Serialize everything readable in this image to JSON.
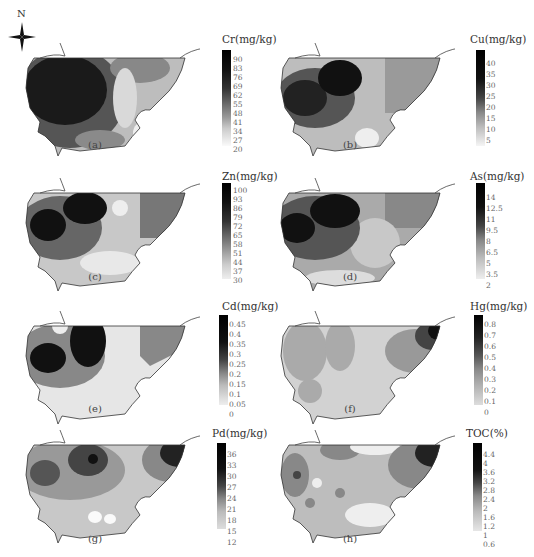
{
  "figure": {
    "north_label": "N",
    "panels": [
      {
        "id": "a",
        "caption": "(a)",
        "legend_title": "Cr(mg/kg)",
        "ticks": [
          "90",
          "83",
          "76",
          "69",
          "62",
          "55",
          "48",
          "41",
          "34",
          "27",
          "20"
        ]
      },
      {
        "id": "b",
        "caption": "(b)",
        "legend_title": "Cu(mg/kg)",
        "ticks": [
          "40",
          "35",
          "30",
          "25",
          "20",
          "15",
          "10",
          "5"
        ]
      },
      {
        "id": "c",
        "caption": "(c)",
        "legend_title": "Zn(mg/kg)",
        "ticks": [
          "100",
          "93",
          "86",
          "79",
          "72",
          "65",
          "58",
          "51",
          "44",
          "37",
          "30"
        ]
      },
      {
        "id": "d",
        "caption": "(d)",
        "legend_title": "As(mg/kg)",
        "ticks": [
          "14",
          "12.5",
          "11",
          "9.5",
          "8",
          "6.5",
          "5",
          "3.5",
          "2"
        ]
      },
      {
        "id": "e",
        "caption": "(e)",
        "legend_title": "Cd(mg/kg)",
        "ticks": [
          "0.45",
          "0.4",
          "0.35",
          "0.3",
          "0.25",
          "0.2",
          "0.15",
          "0.1",
          "0.05",
          "0"
        ]
      },
      {
        "id": "f",
        "caption": "(f)",
        "legend_title": "Hg(mg/kg)",
        "ticks": [
          "0.8",
          "0.7",
          "0.6",
          "0.5",
          "0.4",
          "0.3",
          "0.2",
          "0.1",
          "0"
        ]
      },
      {
        "id": "g",
        "caption": "(g)",
        "legend_title": "Pd(mg/kg)",
        "ticks": [
          "36",
          "33",
          "30",
          "27",
          "24",
          "21",
          "18",
          "15",
          "12"
        ]
      },
      {
        "id": "h",
        "caption": "(h)",
        "legend_title": "TOC(%)",
        "ticks": [
          "4.4",
          "4",
          "3.6",
          "3.2",
          "2.8",
          "2.4",
          "2",
          "1.6",
          "1.2",
          "1",
          "0.6"
        ]
      }
    ]
  }
}
